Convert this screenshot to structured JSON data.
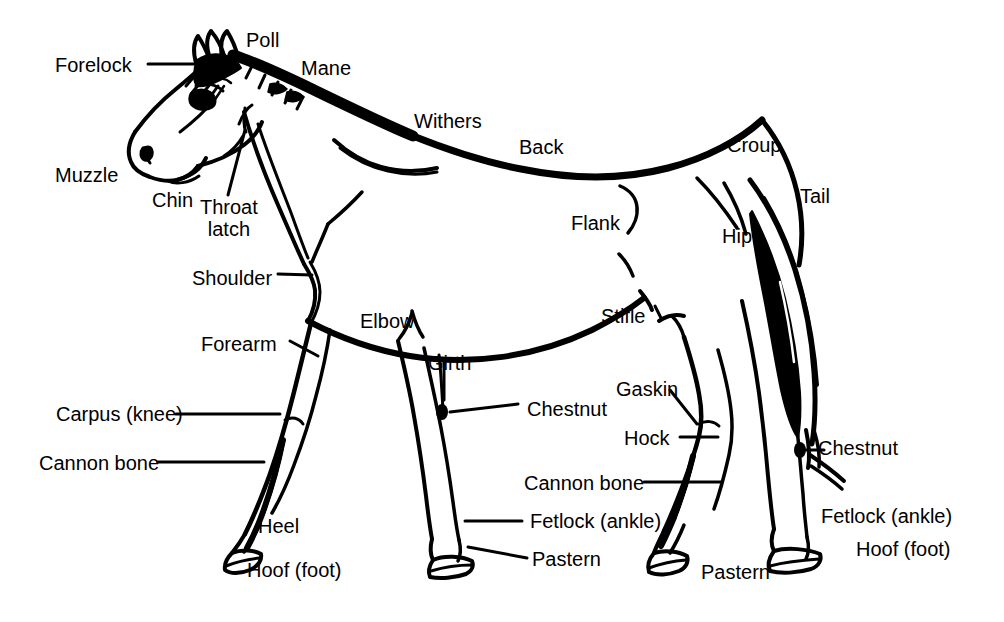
{
  "diagram": {
    "style": "black line art on white background",
    "background_color": "#ffffff",
    "line_color": "#000000",
    "text_color": "#000000",
    "font_size_px": 20,
    "canvas": {
      "width": 1004,
      "height": 622
    }
  },
  "labels": [
    {
      "id": "forelock",
      "text": "Forelock",
      "x": 55,
      "y": 54,
      "leader": true
    },
    {
      "id": "poll",
      "text": "Poll",
      "x": 246,
      "y": 29,
      "leader": false
    },
    {
      "id": "mane",
      "text": "Mane",
      "x": 301,
      "y": 57,
      "leader": false
    },
    {
      "id": "withers",
      "text": "Withers",
      "x": 414,
      "y": 110,
      "leader": false
    },
    {
      "id": "back",
      "text": "Back",
      "x": 519,
      "y": 136,
      "leader": false
    },
    {
      "id": "croup",
      "text": "Croup",
      "x": 727,
      "y": 134,
      "leader": false
    },
    {
      "id": "tail",
      "text": "Tail",
      "x": 800,
      "y": 185,
      "leader": false
    },
    {
      "id": "hip",
      "text": "Hip",
      "x": 722,
      "y": 225,
      "leader": false
    },
    {
      "id": "flank",
      "text": "Flank",
      "x": 571,
      "y": 212,
      "leader": false
    },
    {
      "id": "muzzle",
      "text": "Muzzle",
      "x": 55,
      "y": 164,
      "leader": false
    },
    {
      "id": "chin",
      "text": "Chin",
      "x": 152,
      "y": 189,
      "leader": false
    },
    {
      "id": "throat-latch",
      "text": "Throat\nlatch",
      "x": 200,
      "y": 196,
      "leader": true,
      "multiline": true
    },
    {
      "id": "shoulder",
      "text": "Shoulder",
      "x": 192,
      "y": 267,
      "leader": true
    },
    {
      "id": "forearm",
      "text": "Forearm",
      "x": 201,
      "y": 333,
      "leader": true
    },
    {
      "id": "carpus-knee",
      "text": "Carpus (knee)",
      "x": 56,
      "y": 403,
      "leader": true
    },
    {
      "id": "cannon-bone-fr",
      "text": "Cannon bone",
      "x": 39,
      "y": 452,
      "leader": true
    },
    {
      "id": "heel",
      "text": "Heel",
      "x": 258,
      "y": 515,
      "leader": false
    },
    {
      "id": "hoof-foot-fr",
      "text": "Hoof (foot)",
      "x": 247,
      "y": 559,
      "leader": false
    },
    {
      "id": "elbow",
      "text": "Elbow",
      "x": 360,
      "y": 310,
      "leader": false
    },
    {
      "id": "girth",
      "text": "Girth",
      "x": 428,
      "y": 352,
      "leader": true
    },
    {
      "id": "chestnut-front",
      "text": "Chestnut",
      "x": 527,
      "y": 398,
      "leader": true
    },
    {
      "id": "fetlock-front",
      "text": "Fetlock (ankle)",
      "x": 530,
      "y": 510,
      "leader": true
    },
    {
      "id": "pastern-front",
      "text": "Pastern",
      "x": 532,
      "y": 548,
      "leader": true
    },
    {
      "id": "stifle",
      "text": "Stifle",
      "x": 601,
      "y": 305,
      "leader": false
    },
    {
      "id": "gaskin",
      "text": "Gaskin",
      "x": 616,
      "y": 378,
      "leader": true
    },
    {
      "id": "hock",
      "text": "Hock",
      "x": 624,
      "y": 427,
      "leader": true
    },
    {
      "id": "cannon-bone-hind",
      "text": "Cannon bone",
      "x": 524,
      "y": 472,
      "leader": true
    },
    {
      "id": "fetlock-hind",
      "text": "Fetlock (ankle)",
      "x": 821,
      "y": 505,
      "leader": false
    },
    {
      "id": "pastern-hind",
      "text": "Pastern",
      "x": 701,
      "y": 561,
      "leader": false
    },
    {
      "id": "chestnut-hind",
      "text": "Chestnut",
      "x": 818,
      "y": 437,
      "leader": true
    },
    {
      "id": "hoof-foot-hind",
      "text": "Hoof (foot)",
      "x": 856,
      "y": 538,
      "leader": false
    }
  ]
}
